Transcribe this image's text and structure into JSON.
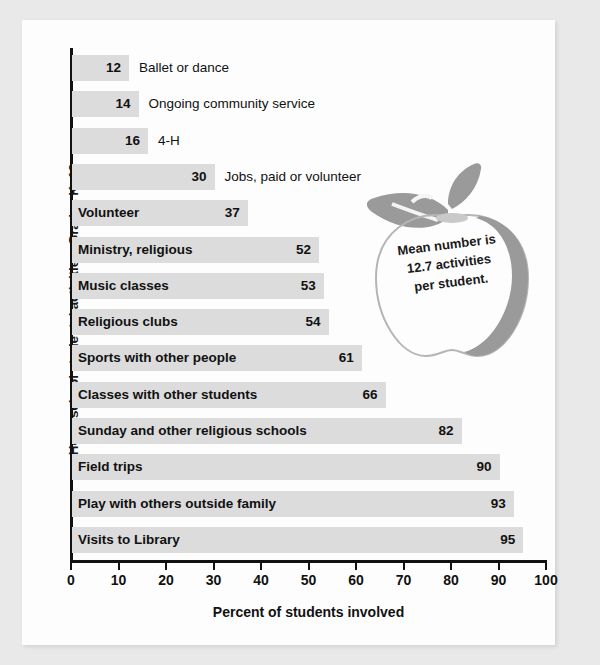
{
  "chart_data": {
    "type": "bar",
    "orientation": "horizontal",
    "title": "",
    "xlabel": "Percent of students involved",
    "ylabel": "Homeschool students' activities, Grades K–12",
    "xlim": [
      0,
      100
    ],
    "xticks": [
      0,
      10,
      20,
      30,
      40,
      50,
      60,
      70,
      80,
      90,
      100
    ],
    "grid": false,
    "legend": null,
    "bar_color": "#dcdcdc",
    "categories": [
      "Ballet or dance",
      "Ongoing community service",
      "4-H",
      "Jobs, paid or volunteer",
      "Volunteer",
      "Ministry, religious",
      "Music classes",
      "Religious clubs",
      "Sports with other people",
      "Classes with other students",
      "Sunday and other religious schools",
      "Field trips",
      "Play with others outside family",
      "Visits to Library"
    ],
    "values": [
      12,
      14,
      16,
      30,
      37,
      52,
      53,
      54,
      61,
      66,
      82,
      90,
      93,
      95
    ],
    "annotations": [
      {
        "name": "apple-callout",
        "text": "Mean number is 12.7 activities per student.",
        "lines": [
          "Mean number is",
          "12.7 activities",
          "per student."
        ],
        "mean": 12.7,
        "shape": "apple",
        "shape_color": "#9a9a9a"
      }
    ]
  },
  "axis": {
    "xlabel": "Percent of students involved",
    "ylabel": "Homeschool students' activities, Grades K–12",
    "ticks": [
      "0",
      "10",
      "20",
      "30",
      "40",
      "50",
      "60",
      "70",
      "80",
      "90",
      "100"
    ]
  },
  "bars": [
    {
      "label": "Ballet or dance",
      "value": 12,
      "value_text": "12",
      "label_inside": false
    },
    {
      "label": "Ongoing community service",
      "value": 14,
      "value_text": "14",
      "label_inside": false
    },
    {
      "label": "4-H",
      "value": 16,
      "value_text": "16",
      "label_inside": false
    },
    {
      "label": "Jobs, paid or volunteer",
      "value": 30,
      "value_text": "30",
      "label_inside": false
    },
    {
      "label": "Volunteer",
      "value": 37,
      "value_text": "37",
      "label_inside": true
    },
    {
      "label": "Ministry, religious",
      "value": 52,
      "value_text": "52",
      "label_inside": true
    },
    {
      "label": "Music classes",
      "value": 53,
      "value_text": "53",
      "label_inside": true
    },
    {
      "label": "Religious clubs",
      "value": 54,
      "value_text": "54",
      "label_inside": true
    },
    {
      "label": "Sports with other people",
      "value": 61,
      "value_text": "61",
      "label_inside": true
    },
    {
      "label": "Classes with other students",
      "value": 66,
      "value_text": "66",
      "label_inside": true
    },
    {
      "label": "Sunday and other religious schools",
      "value": 82,
      "value_text": "82",
      "label_inside": true
    },
    {
      "label": "Field trips",
      "value": 90,
      "value_text": "90",
      "label_inside": true
    },
    {
      "label": "Play with others outside family",
      "value": 93,
      "value_text": "93",
      "label_inside": true
    },
    {
      "label": "Visits to Library",
      "value": 95,
      "value_text": "95",
      "label_inside": true
    }
  ],
  "callout": {
    "line1": "Mean number is",
    "line2": "12.7 activities",
    "line3": "per student."
  }
}
